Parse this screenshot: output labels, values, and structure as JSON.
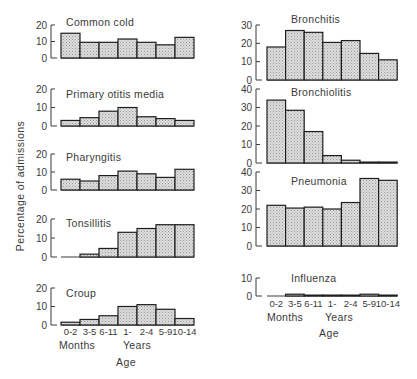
{
  "chart_data": {
    "type": "bar",
    "title": "",
    "ylabel": "Percentage of admissions",
    "xlabel": "Age",
    "categories": [
      "0-2",
      "3-5",
      "6-11",
      "1-",
      "2-4",
      "5-9",
      "10-14"
    ],
    "category_groups": [
      {
        "label": "Months",
        "categories": [
          "0-2",
          "3-5",
          "6-11"
        ]
      },
      {
        "label": "Years",
        "categories": [
          "1-",
          "2-4",
          "5-9",
          "10-14"
        ]
      }
    ],
    "grid": false,
    "legend": null,
    "panels": [
      {
        "id": "common-cold",
        "column": "left",
        "title": "Common cold",
        "ylim": [
          0,
          20
        ],
        "yticks": [
          0,
          10,
          20
        ],
        "values": [
          15,
          9.5,
          9.5,
          11.5,
          9.5,
          8,
          12.5
        ]
      },
      {
        "id": "primary-otitis-media",
        "column": "left",
        "title": "Primary otitis media",
        "ylim": [
          0,
          20
        ],
        "yticks": [
          0,
          10,
          20
        ],
        "values": [
          3,
          4.5,
          8,
          10,
          5,
          4,
          3
        ]
      },
      {
        "id": "pharyngitis",
        "column": "left",
        "title": "Pharyngitis",
        "ylim": [
          0,
          20
        ],
        "yticks": [
          0,
          10,
          20
        ],
        "values": [
          6,
          5,
          8,
          10.5,
          9,
          7,
          11.5
        ]
      },
      {
        "id": "tonsillitis",
        "column": "left",
        "title": "Tonsillitis",
        "ylim": [
          0,
          20
        ],
        "yticks": [
          0,
          10,
          20
        ],
        "values": [
          0,
          1.5,
          4.5,
          13,
          15,
          17,
          17
        ]
      },
      {
        "id": "croup",
        "column": "left",
        "title": "Croup",
        "ylim": [
          0,
          20
        ],
        "yticks": [
          0,
          10,
          20
        ],
        "values": [
          1.5,
          3,
          5,
          10,
          11,
          8.5,
          3.5
        ]
      },
      {
        "id": "bronchitis",
        "column": "right",
        "title": "Bronchitis",
        "ylim": [
          0,
          30
        ],
        "yticks": [
          0,
          10,
          20,
          30
        ],
        "values": [
          18,
          27,
          26,
          20.5,
          21.5,
          14.5,
          11
        ]
      },
      {
        "id": "bronchiolitis",
        "column": "right",
        "title": "Bronchiolitis",
        "ylim": [
          0,
          40
        ],
        "yticks": [
          0,
          10,
          20,
          30,
          40
        ],
        "values": [
          34,
          28.5,
          17,
          4,
          1.5,
          0.5,
          0.5
        ]
      },
      {
        "id": "pneumonia",
        "column": "right",
        "title": "Pneumonia",
        "ylim": [
          0,
          40
        ],
        "yticks": [
          0,
          10,
          20,
          30,
          40
        ],
        "values": [
          22,
          20.5,
          21,
          20,
          23.5,
          36.5,
          35.5
        ]
      },
      {
        "id": "influenza",
        "column": "right",
        "title": "Influenza",
        "ylim": [
          0,
          10
        ],
        "yticks": [
          0,
          10
        ],
        "values": [
          0,
          1,
          0.5,
          0.5,
          0.5,
          1,
          0.5
        ]
      }
    ]
  }
}
